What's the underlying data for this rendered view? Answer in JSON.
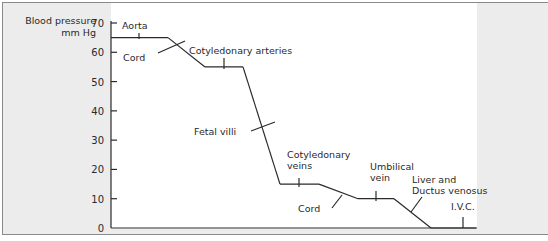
{
  "chart_data": {
    "type": "line",
    "title": "",
    "ylabel": "Blood pressure mm Hg",
    "ylabel_lines": [
      "Blood pressure",
      "mm Hg"
    ],
    "xlabel": "",
    "ylim": [
      0,
      70
    ],
    "yticks": [
      0,
      10,
      20,
      30,
      40,
      50,
      60,
      70
    ],
    "grid": false,
    "segments": [
      {
        "name": "Aorta",
        "pressure": 65
      },
      {
        "name": "Cord",
        "pressure_from": 65,
        "pressure_to": 55,
        "kind": "transition"
      },
      {
        "name": "Cotyledonary arteries",
        "pressure": 55
      },
      {
        "name": "Fetal villi",
        "pressure_from": 55,
        "pressure_to": 15,
        "kind": "transition"
      },
      {
        "name": "Cotyledonary veins",
        "pressure": 15
      },
      {
        "name": "Cord",
        "pressure_from": 15,
        "pressure_to": 10,
        "kind": "transition"
      },
      {
        "name": "Umbilical vein",
        "pressure": 10
      },
      {
        "name": "Liver and Ductus venosus",
        "pressure_from": 10,
        "pressure_to": 0,
        "kind": "transition"
      },
      {
        "name": "I.V.C.",
        "pressure": 0
      }
    ],
    "points": [
      {
        "x": 0,
        "y": 65
      },
      {
        "x": 1.5,
        "y": 65
      },
      {
        "x": 2.5,
        "y": 55
      },
      {
        "x": 3.5,
        "y": 55
      },
      {
        "x": 4.5,
        "y": 15
      },
      {
        "x": 5.5,
        "y": 15
      },
      {
        "x": 6.5,
        "y": 10
      },
      {
        "x": 7.5,
        "y": 10
      },
      {
        "x": 8.5,
        "y": 0
      },
      {
        "x": 9.7,
        "y": 0
      }
    ],
    "annotations": [
      {
        "lines": [
          "Aorta"
        ]
      },
      {
        "lines": [
          "Cord"
        ]
      },
      {
        "lines": [
          "Cotyledonary arteries"
        ]
      },
      {
        "lines": [
          "Fetal villi"
        ]
      },
      {
        "lines": [
          "Cotyledonary",
          "veins"
        ]
      },
      {
        "lines": [
          "Cord"
        ]
      },
      {
        "lines": [
          "Umbilical",
          "vein"
        ]
      },
      {
        "lines": [
          "Liver and",
          "Ductus venosus"
        ]
      },
      {
        "lines": [
          "I.V.C."
        ]
      }
    ]
  }
}
